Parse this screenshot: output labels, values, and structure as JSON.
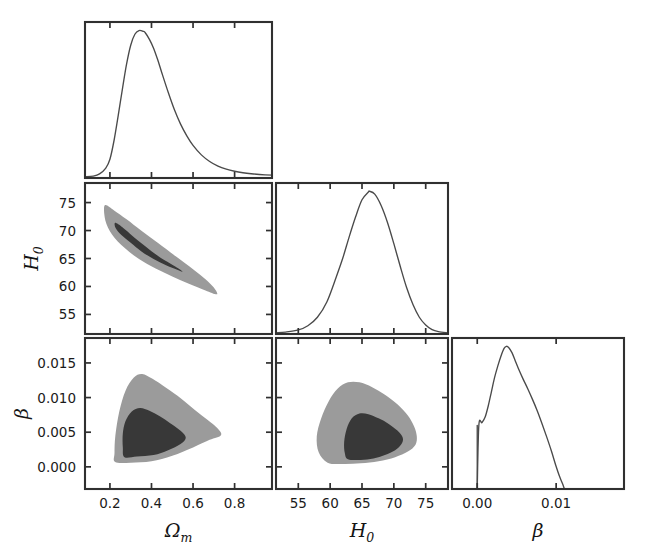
{
  "figure": {
    "kind": "corner-plot",
    "background": "#ffffff",
    "width": 648,
    "height": 558
  },
  "style": {
    "outer_contour_color": "#9b9b9b",
    "inner_contour_color": "#383838",
    "curve_color": "#4a4a4a",
    "frame_color": "#303030",
    "text_color": "#1a1a1a"
  },
  "parameters": [
    {
      "key": "omega_m",
      "label": "Ω",
      "sub": "m",
      "axis_label": "Ωm"
    },
    {
      "key": "h0",
      "label": "H",
      "sub": "0",
      "axis_label": "H0"
    },
    {
      "key": "beta",
      "label": "β",
      "sub": "",
      "axis_label": "β"
    }
  ],
  "axes": {
    "omega_m": {
      "range": [
        0.08,
        0.98
      ],
      "ticks": [
        0.2,
        0.4,
        0.6,
        0.8
      ],
      "tick_labels": [
        "0.2",
        "0.4",
        "0.6",
        "0.8"
      ]
    },
    "h0": {
      "range": [
        51.5,
        78.5
      ],
      "ticks": [
        55,
        60,
        65,
        70,
        75
      ],
      "tick_labels": [
        "55",
        "60",
        "65",
        "70",
        "75"
      ]
    },
    "beta": {
      "range": [
        -0.0032,
        0.0186
      ],
      "ticks": [
        0.0,
        0.005,
        0.01,
        0.015
      ],
      "tick_labels": [
        "0.000",
        "0.005",
        "0.010",
        "0.015"
      ],
      "ticks_bottom": [
        0.0,
        0.01
      ],
      "tick_labels_bottom": [
        "0.00",
        "0.01"
      ]
    }
  },
  "chart_data": {
    "type": "scatter",
    "title": "",
    "xlabel": "",
    "ylabel": "",
    "layout": "corner (lower-triangle) posterior plot, 3 parameters",
    "grid": false,
    "legend": "none",
    "panels": [
      {
        "id": "omega_m-marginal",
        "row": 0,
        "col": 0,
        "kind": "marginal-1d",
        "x_param": "omega_m",
        "xlim": [
          0.08,
          0.98
        ],
        "xticks": [
          0.2,
          0.4,
          0.6,
          0.8
        ],
        "show_xticklabels": false,
        "show_yticklabels": false,
        "peak_x": 0.37,
        "description": "right-skewed unimodal posterior for Omega_m",
        "density_x": [
          0.08,
          0.12,
          0.15,
          0.18,
          0.2,
          0.22,
          0.24,
          0.26,
          0.28,
          0.3,
          0.32,
          0.34,
          0.36,
          0.37,
          0.39,
          0.41,
          0.43,
          0.45,
          0.48,
          0.51,
          0.54,
          0.57,
          0.6,
          0.64,
          0.68,
          0.72,
          0.76,
          0.8,
          0.84,
          0.88,
          0.92,
          0.98
        ],
        "density_y": [
          0.0,
          0.005,
          0.02,
          0.06,
          0.12,
          0.25,
          0.42,
          0.6,
          0.77,
          0.9,
          0.975,
          1.0,
          0.995,
          0.985,
          0.94,
          0.88,
          0.8,
          0.71,
          0.58,
          0.46,
          0.36,
          0.28,
          0.215,
          0.15,
          0.105,
          0.073,
          0.052,
          0.038,
          0.028,
          0.021,
          0.016,
          0.011
        ]
      },
      {
        "id": "h0-vs-omega_m",
        "row": 1,
        "col": 0,
        "kind": "contour-2d",
        "x_param": "omega_m",
        "y_param": "h0",
        "xlim": [
          0.08,
          0.98
        ],
        "ylim": [
          51.5,
          78.5
        ],
        "xticks": [
          0.2,
          0.4,
          0.6,
          0.8
        ],
        "yticks": [
          55,
          60,
          65,
          70,
          75
        ],
        "show_xticklabels": false,
        "show_yticklabels": true,
        "correlation": "strong negative (degeneracy between Omega_m and H0)",
        "contour_68_points": [
          [
            0.225,
            71.4
          ],
          [
            0.26,
            70.6
          ],
          [
            0.31,
            69.0
          ],
          [
            0.37,
            67.2
          ],
          [
            0.43,
            65.5
          ],
          [
            0.49,
            64.1
          ],
          [
            0.53,
            63.2
          ],
          [
            0.55,
            62.6
          ],
          [
            0.53,
            62.9
          ],
          [
            0.47,
            63.8
          ],
          [
            0.41,
            64.9
          ],
          [
            0.35,
            66.3
          ],
          [
            0.3,
            67.8
          ],
          [
            0.255,
            69.2
          ],
          [
            0.228,
            70.4
          ]
        ],
        "contour_95_points": [
          [
            0.175,
            74.5
          ],
          [
            0.22,
            73.6
          ],
          [
            0.28,
            72.0
          ],
          [
            0.35,
            70.0
          ],
          [
            0.43,
            67.8
          ],
          [
            0.52,
            65.3
          ],
          [
            0.6,
            63.1
          ],
          [
            0.66,
            61.3
          ],
          [
            0.7,
            59.8
          ],
          [
            0.715,
            58.6
          ],
          [
            0.66,
            59.3
          ],
          [
            0.58,
            60.5
          ],
          [
            0.5,
            61.8
          ],
          [
            0.42,
            63.2
          ],
          [
            0.34,
            64.9
          ],
          [
            0.27,
            66.9
          ],
          [
            0.21,
            69.3
          ],
          [
            0.178,
            71.8
          ]
        ]
      },
      {
        "id": "h0-marginal",
        "row": 1,
        "col": 1,
        "kind": "marginal-1d",
        "x_param": "h0",
        "xlim": [
          51.5,
          78.5
        ],
        "xticks": [
          55,
          60,
          65,
          70,
          75
        ],
        "show_xticklabels": false,
        "show_yticklabels": false,
        "peak_x": 66.2,
        "description": "near-Gaussian posterior for H0, mean ~66.2, sigma ~3.4",
        "density_x": [
          51.5,
          53,
          55,
          56.5,
          58,
          59.5,
          61,
          62,
          63,
          64,
          65,
          66,
          66.2,
          67,
          68,
          69,
          70,
          71,
          72,
          73,
          74,
          75,
          76,
          77,
          78.5
        ],
        "density_y": [
          0.0,
          0.005,
          0.02,
          0.05,
          0.11,
          0.22,
          0.4,
          0.53,
          0.68,
          0.82,
          0.94,
          0.995,
          1.0,
          0.98,
          0.9,
          0.78,
          0.63,
          0.47,
          0.32,
          0.2,
          0.11,
          0.055,
          0.022,
          0.008,
          0.0
        ]
      },
      {
        "id": "beta-vs-omega_m",
        "row": 2,
        "col": 0,
        "kind": "contour-2d",
        "x_param": "omega_m",
        "y_param": "beta",
        "xlim": [
          0.08,
          0.98
        ],
        "ylim": [
          -0.0032,
          0.0186
        ],
        "xticks": [
          0.2,
          0.4,
          0.6,
          0.8
        ],
        "yticks": [
          0.0,
          0.005,
          0.01,
          0.015
        ],
        "show_xticklabels": true,
        "show_yticklabels": true,
        "correlation": "weak; beta bounded below at 0",
        "contour_68_points": [
          [
            0.27,
            0.0014
          ],
          [
            0.33,
            0.0015
          ],
          [
            0.41,
            0.0017
          ],
          [
            0.48,
            0.0024
          ],
          [
            0.54,
            0.0033
          ],
          [
            0.565,
            0.0042
          ],
          [
            0.54,
            0.0052
          ],
          [
            0.49,
            0.0063
          ],
          [
            0.44,
            0.0073
          ],
          [
            0.39,
            0.0081
          ],
          [
            0.345,
            0.0085
          ],
          [
            0.305,
            0.008
          ],
          [
            0.275,
            0.0066
          ],
          [
            0.262,
            0.0048
          ],
          [
            0.262,
            0.0028
          ]
        ],
        "contour_95_points": [
          [
            0.225,
            0.0007
          ],
          [
            0.3,
            0.0006
          ],
          [
            0.4,
            0.0008
          ],
          [
            0.5,
            0.0016
          ],
          [
            0.6,
            0.0028
          ],
          [
            0.68,
            0.0039
          ],
          [
            0.735,
            0.0046
          ],
          [
            0.71,
            0.0058
          ],
          [
            0.63,
            0.0077
          ],
          [
            0.545,
            0.0098
          ],
          [
            0.47,
            0.0114
          ],
          [
            0.405,
            0.0127
          ],
          [
            0.355,
            0.0134
          ],
          [
            0.315,
            0.0129
          ],
          [
            0.275,
            0.011
          ],
          [
            0.245,
            0.008
          ],
          [
            0.226,
            0.0045
          ],
          [
            0.222,
            0.002
          ]
        ]
      },
      {
        "id": "beta-vs-h0",
        "row": 2,
        "col": 1,
        "kind": "contour-2d",
        "x_param": "h0",
        "y_param": "beta",
        "xlim": [
          51.5,
          78.5
        ],
        "ylim": [
          -0.0032,
          0.0186
        ],
        "xticks": [
          55,
          60,
          65,
          70,
          75
        ],
        "yticks": [
          0.0,
          0.005,
          0.01,
          0.015
        ],
        "show_xticklabels": true,
        "show_yticklabels": false,
        "correlation": "weak; beta bounded below at 0",
        "contour_68_points": [
          [
            62.8,
            0.0011
          ],
          [
            64.8,
            0.001
          ],
          [
            66.8,
            0.0012
          ],
          [
            68.6,
            0.0017
          ],
          [
            70.2,
            0.0024
          ],
          [
            71.2,
            0.0033
          ],
          [
            71.4,
            0.0042
          ],
          [
            70.6,
            0.0052
          ],
          [
            69.2,
            0.0062
          ],
          [
            67.6,
            0.007
          ],
          [
            66.0,
            0.0076
          ],
          [
            64.6,
            0.0077
          ],
          [
            63.4,
            0.007
          ],
          [
            62.6,
            0.0055
          ],
          [
            62.2,
            0.0036
          ],
          [
            62.3,
            0.002
          ]
        ],
        "contour_95_points": [
          [
            59.6,
            0.0006
          ],
          [
            62.0,
            0.0004
          ],
          [
            64.8,
            0.0005
          ],
          [
            67.6,
            0.0008
          ],
          [
            70.2,
            0.0014
          ],
          [
            72.2,
            0.0022
          ],
          [
            73.4,
            0.0032
          ],
          [
            73.6,
            0.0044
          ],
          [
            73.2,
            0.0058
          ],
          [
            72.2,
            0.0074
          ],
          [
            70.6,
            0.009
          ],
          [
            68.6,
            0.0104
          ],
          [
            66.6,
            0.0115
          ],
          [
            64.6,
            0.0122
          ],
          [
            62.8,
            0.0122
          ],
          [
            61.2,
            0.0113
          ],
          [
            59.8,
            0.0095
          ],
          [
            58.6,
            0.007
          ],
          [
            57.9,
            0.0044
          ],
          [
            58.2,
            0.0021
          ]
        ]
      },
      {
        "id": "beta-marginal",
        "row": 2,
        "col": 2,
        "kind": "marginal-1d",
        "x_param": "beta",
        "xlim": [
          -0.0032,
          0.0186
        ],
        "xticks": [
          0.0,
          0.01
        ],
        "show_xticklabels": true,
        "show_yticklabels": false,
        "peak_x": 0.0037,
        "description": "posterior for beta, hard cut at 0, peak ~0.0037, tail to ~0.011",
        "density_x": [
          0.0,
          0.0002,
          0.0006,
          0.001,
          0.0014,
          0.0018,
          0.0022,
          0.0026,
          0.003,
          0.0034,
          0.0037,
          0.004,
          0.0044,
          0.0048,
          0.0052,
          0.0058,
          0.0064,
          0.007,
          0.0076,
          0.0082,
          0.0088,
          0.0094,
          0.01,
          0.0104,
          0.0108,
          0.011
        ],
        "density_y": [
          0.0,
          0.44,
          0.46,
          0.5,
          0.58,
          0.68,
          0.78,
          0.86,
          0.93,
          0.985,
          1.0,
          0.99,
          0.955,
          0.9,
          0.845,
          0.77,
          0.7,
          0.625,
          0.545,
          0.455,
          0.36,
          0.26,
          0.15,
          0.085,
          0.03,
          0.0
        ]
      }
    ]
  },
  "labels": {
    "x_axis_bottom": [
      {
        "panel": "beta-vs-omega_m",
        "text": "Ω",
        "sub": "m"
      },
      {
        "panel": "beta-vs-h0",
        "text": "H",
        "sub": "0"
      },
      {
        "panel": "beta-marginal",
        "text": "β",
        "sub": ""
      }
    ],
    "y_axis_left": [
      {
        "panel": "h0-vs-omega_m",
        "text": "H",
        "sub": "0"
      },
      {
        "panel": "beta-vs-omega_m",
        "text": "β",
        "sub": ""
      }
    ]
  }
}
